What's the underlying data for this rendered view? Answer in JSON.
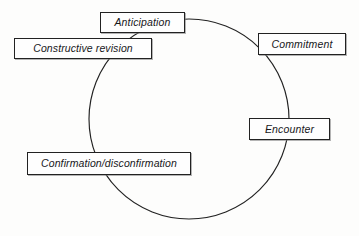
{
  "diagram": {
    "type": "cycle",
    "title": "",
    "shape": "circle",
    "stroke_color": "#222222",
    "box_fill_color": "#fefefe",
    "background_color": "#fdfdfc",
    "nodes": [
      {
        "id": "anticipation",
        "label": "Anticipation",
        "order": 1
      },
      {
        "id": "commitment",
        "label": "Commitment",
        "order": 2
      },
      {
        "id": "encounter",
        "label": "Encounter",
        "order": 3
      },
      {
        "id": "confirmation",
        "label": "Confirmation/disconfirmation",
        "order": 4
      },
      {
        "id": "revision",
        "label": "Constructive revision",
        "order": 5
      }
    ]
  }
}
